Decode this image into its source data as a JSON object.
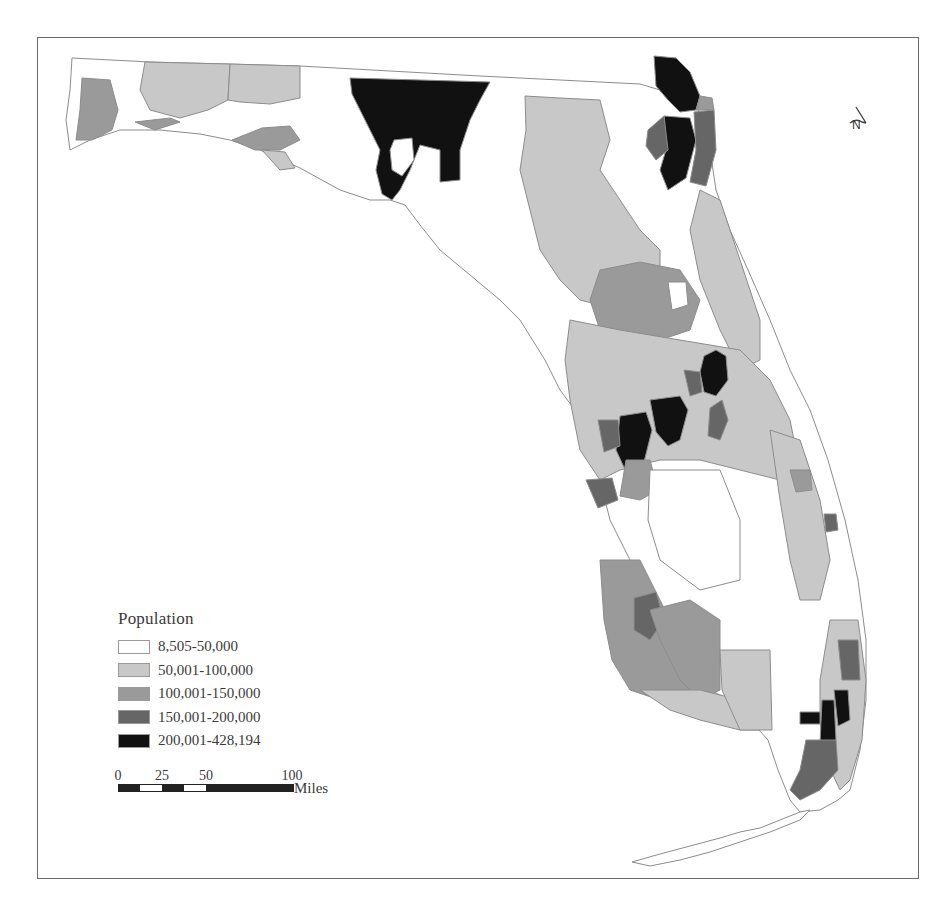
{
  "figure": {
    "type": "choropleth-map",
    "region": "Florida",
    "frame": true
  },
  "legend": {
    "title": "Population",
    "classes": [
      {
        "label": "8,505-50,000",
        "color": "#ffffff"
      },
      {
        "label": "50,001-100,000",
        "color": "#c8c8c8"
      },
      {
        "label": "100,001-150,000",
        "color": "#9a9a9a"
      },
      {
        "label": "150,001-200,000",
        "color": "#666666"
      },
      {
        "label": "200,001-428,194",
        "color": "#111111"
      }
    ]
  },
  "scale_bar": {
    "ticks": [
      "0",
      "25",
      "50",
      "100"
    ],
    "unit": "Miles"
  },
  "north_arrow": {
    "label": "N",
    "icon": "north-arrow-icon"
  },
  "colors": {
    "frame": "#6a6a6a",
    "boundary": "#8c8c8c",
    "text": "#3a3a3a"
  }
}
